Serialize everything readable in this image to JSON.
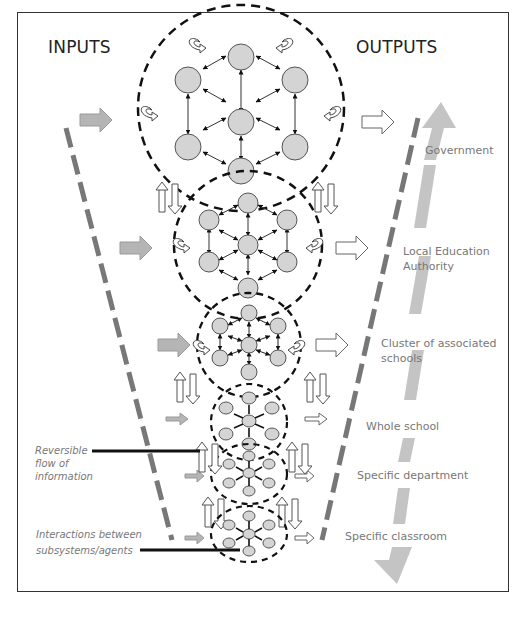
{
  "diagram": {
    "headers": {
      "inputs": "INPUTS",
      "outputs": "OUTPUTS"
    },
    "levels": [
      {
        "label": "Government"
      },
      {
        "label": "Local Education Authority",
        "line1": "Local Education",
        "line2": "Authority"
      },
      {
        "label": "Cluster of associated schools",
        "line1": "Cluster of associated",
        "line2": "schools"
      },
      {
        "label": "Whole school"
      },
      {
        "label": "Specific department"
      },
      {
        "label": "Specific classroom"
      }
    ],
    "annotations": {
      "reversible": {
        "line1": "Reversible",
        "line2": "flow of",
        "line3": "information"
      },
      "interactions": {
        "line1": "Interactions between",
        "line2": "subsystems/agents"
      }
    },
    "colors": {
      "node_fill": "#d4d4d4",
      "node_stroke": "#555555",
      "input_arrow": "#b5b5b5",
      "scale_arrow": "#c4c4c4",
      "dash_line": "#777777",
      "label_text": "#777777"
    },
    "icons": {
      "input_arrow": "gray-right-arrow",
      "output_arrow": "hollow-right-arrow",
      "feedback_arrow": "curved-loop-arrow",
      "vertical_flow": "up-down-hollow-arrows"
    }
  }
}
